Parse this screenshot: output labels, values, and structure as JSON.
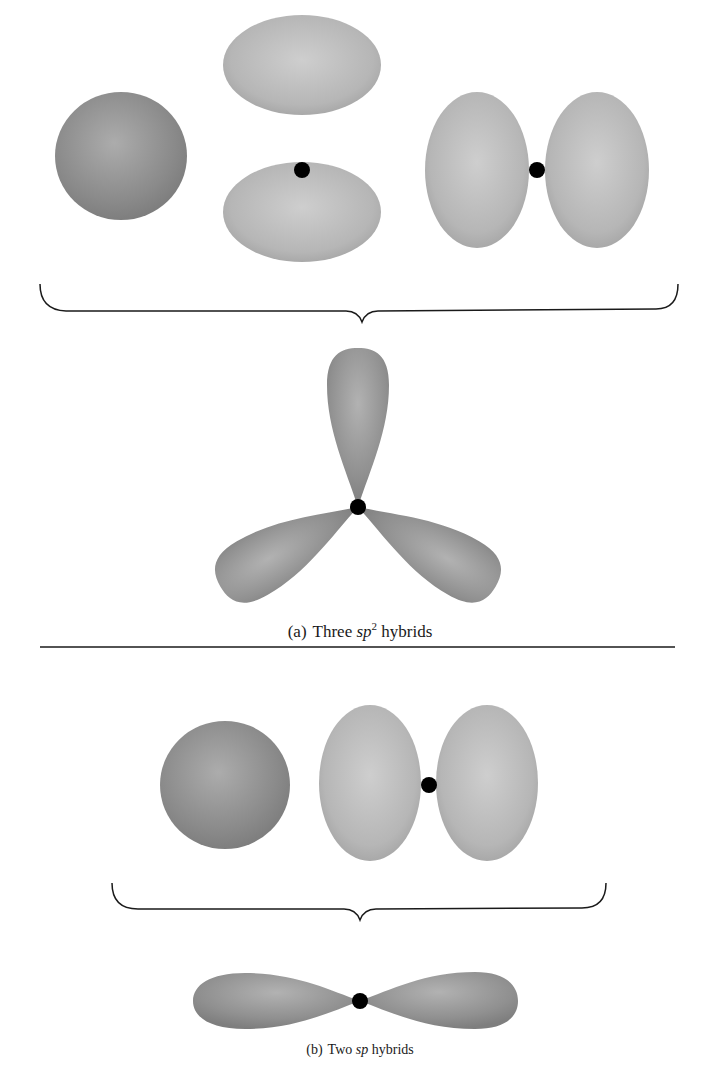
{
  "figure": {
    "panel_a": {
      "caption_prefix": "(a)",
      "caption_main": "Three ",
      "caption_italic": "sp",
      "caption_sup": "2",
      "caption_suffix": " hybrids",
      "components": [
        "s orbital",
        "p orbital (vertical)",
        "p orbital (horizontal)"
      ],
      "result": "three sp2 hybrid orbitals at 120°"
    },
    "panel_b": {
      "caption_prefix": "(b)",
      "caption_main": "Two ",
      "caption_italic": "sp",
      "caption_suffix": " hybrids",
      "components": [
        "s orbital",
        "p orbital (horizontal)"
      ],
      "result": "two sp hybrid orbitals at 180°"
    },
    "colors": {
      "s_orbital": "#8a8a8a",
      "p_orbital": "#b4b4b4",
      "hybrid": "#8f8f8f",
      "nucleus": "#000000",
      "line": "#1a1a1a"
    }
  }
}
